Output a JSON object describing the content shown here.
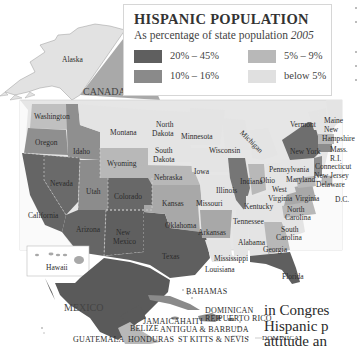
{
  "legend": {
    "title": "HISPANIC POPULATION",
    "subtitle_prefix": "As percentage of state population ",
    "subtitle_year": "2005",
    "items": [
      {
        "label": "20% – 45%",
        "color": "#5f5f5f"
      },
      {
        "label": "5% – 9%",
        "color": "#b8b8b8"
      },
      {
        "label": "10% – 16%",
        "color": "#8a8a8a"
      },
      {
        "label": "below 5%",
        "color": "#e0e0e0"
      }
    ]
  },
  "regions": {
    "alaska": "Alaska",
    "canada": "CANADA",
    "hawaii": "Hawaii",
    "mexico": "MEXICO",
    "dc": "D.C."
  },
  "states": {
    "washington": "Washington",
    "oregon": "Oregon",
    "idaho": "Idaho",
    "montana": "Montana",
    "north_dakota_1": "North",
    "north_dakota_2": "Dakota",
    "south_dakota_1": "South",
    "south_dakota_2": "Dakota",
    "minnesota": "Minnesota",
    "wisconsin": "Wisconsin",
    "michigan": "Michigan",
    "vermont": "Vermont",
    "maine": "Maine",
    "new_hampshire_1": "New",
    "new_hampshire_2": "Hampshire",
    "new_york": "New York",
    "mass": "Mass.",
    "ri": "R.I.",
    "connecticut": "Connecticut",
    "new_jersey": "New Jersey",
    "pennsylvania": "Pennsylvania",
    "delaware": "Delaware",
    "maryland": "Maryland",
    "wyoming": "Wyoming",
    "nebraska": "Nebraska",
    "iowa": "Iowa",
    "illinois": "Illinois",
    "indiana": "Indiana",
    "ohio": "Ohio",
    "west_virginia_1": "West",
    "west_virginia_2": "Virginia",
    "virginia": "Virginia",
    "nevada": "Nevada",
    "utah": "Utah",
    "colorado": "Colorado",
    "kansas": "Kansas",
    "missouri": "Missouri",
    "kentucky": "Kentucky",
    "california": "California",
    "arizona": "Arizona",
    "new_mexico_1": "New",
    "new_mexico_2": "Mexico",
    "oklahoma": "Oklahoma",
    "arkansas": "Arkansas",
    "tennessee": "Tennessee",
    "north_carolina_1": "North",
    "north_carolina_2": "Carolina",
    "south_carolina_1": "South",
    "south_carolina_2": "Carolina",
    "alabama": "Alabama",
    "georgia": "Georgia",
    "mississippi": "Mississippi",
    "louisiana": "Louisiana",
    "texas": "Texas",
    "florida": "Florida"
  },
  "caribbean": {
    "bahamas": "BAHAMAS",
    "cuba": "CUBA",
    "dominican_rep_1": "DOMINICAN",
    "dominican_rep_2": "REP.",
    "jamaica": "JAMAICA",
    "haiti": "HAITI",
    "puerto_rico": "PUERTO RICO",
    "belize": "BELIZE",
    "antigua": "ANTIGUA & BARBUDA",
    "guatemala": "GUATEMALA",
    "honduras": "HONDURAS",
    "st_kitts": "ST KITTS & NEVIS",
    "dominica": "DOMINICA"
  },
  "body_text": {
    "line1": "in Congres",
    "line2": "Hispanic p",
    "line3": "attitude an"
  }
}
